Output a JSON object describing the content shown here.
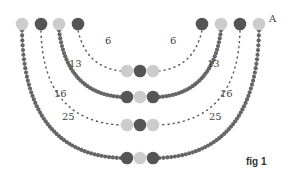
{
  "figure": {
    "caption": "fig 1",
    "point_label": "A",
    "colors": {
      "dark_bead": "#555555",
      "light_bead": "#cccccc",
      "seed_bead": "#666666",
      "thread_dash": "#555555"
    },
    "strands": [
      {
        "id": "strand-1",
        "label": "6",
        "style": "dashed",
        "top_left_x": 78,
        "top_right_x": 202,
        "bottom_y": 71,
        "center_beads": [
          "light",
          "dark",
          "light"
        ],
        "top_left_bead": "dark",
        "top_right_bead": "dark"
      },
      {
        "id": "strand-2",
        "label": "13",
        "style": "seeds",
        "top_left_x": 59,
        "top_right_x": 221,
        "bottom_y": 97,
        "center_beads": [
          "dark",
          "light",
          "dark"
        ],
        "top_left_bead": "light",
        "top_right_bead": "light"
      },
      {
        "id": "strand-3",
        "label": "16",
        "style": "dashed",
        "top_left_x": 41,
        "top_right_x": 240,
        "bottom_y": 125,
        "center_beads": [
          "light",
          "dark",
          "light"
        ],
        "top_left_bead": "dark",
        "top_right_bead": "dark"
      },
      {
        "id": "strand-4",
        "label": "25",
        "style": "seeds",
        "top_left_x": 22,
        "top_right_x": 259,
        "bottom_y": 158,
        "center_beads": [
          "dark",
          "light",
          "dark"
        ],
        "top_left_bead": "light",
        "top_right_bead": "light"
      }
    ]
  }
}
